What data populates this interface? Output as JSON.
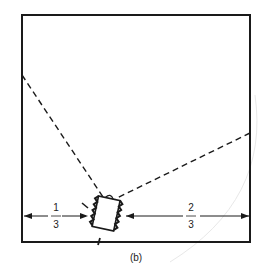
{
  "diagram": {
    "caption": "(b)",
    "left_fraction": {
      "numerator": "1",
      "denominator": "3"
    },
    "right_fraction": {
      "numerator": "2",
      "denominator": "3"
    },
    "elements": {
      "room": "square room outline",
      "speaker": "loudspeaker placed on dimension line, angled toward room corner",
      "sight_lines": [
        "dashed line to left wall",
        "dashed line to right wall"
      ]
    },
    "colors": {
      "ink": "#1a1a1a",
      "background": "#ffffff"
    }
  }
}
